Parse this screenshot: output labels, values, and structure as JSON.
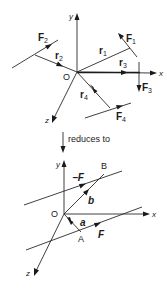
{
  "figure": {
    "top_diagram": {
      "origin_label": "O",
      "axes": {
        "x": "x",
        "y": "y",
        "z": "z"
      },
      "position_vectors": [
        {
          "name": "r",
          "sub": "1"
        },
        {
          "name": "r",
          "sub": "2"
        },
        {
          "name": "r",
          "sub": "3"
        },
        {
          "name": "r",
          "sub": "4"
        }
      ],
      "forces": [
        {
          "name": "F",
          "sub": "1"
        },
        {
          "name": "F",
          "sub": "2"
        },
        {
          "name": "F",
          "sub": "3"
        },
        {
          "name": "F",
          "sub": "4"
        }
      ]
    },
    "transition_label": "reduces to",
    "bottom_diagram": {
      "origin_label": "O",
      "axes": {
        "x": "x",
        "y": "y",
        "z": "z"
      },
      "points": {
        "A": "A",
        "B": "B"
      },
      "vectors": {
        "a": "a",
        "b": "b"
      },
      "forces": {
        "F": "F",
        "neg_F": "−F"
      }
    }
  }
}
